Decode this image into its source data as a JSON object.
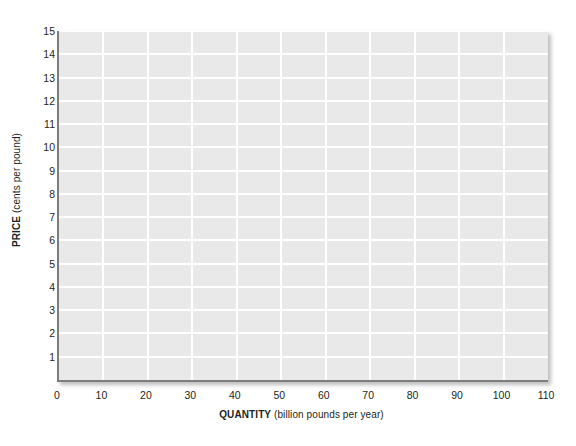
{
  "chart_data": {
    "type": "line",
    "title": "",
    "subtitle": "",
    "xlabel_strong": "QUANTITY",
    "xlabel_weak": " (billion pounds per year)",
    "ylabel_strong": "PRICE",
    "ylabel_weak": " (cents per pound)",
    "xlim": [
      0,
      110
    ],
    "ylim": [
      0,
      15
    ],
    "xticks": [
      0,
      10,
      20,
      30,
      40,
      50,
      60,
      70,
      80,
      90,
      100,
      110
    ],
    "xtick_labels": [
      "0",
      "10",
      "20",
      "30",
      "40",
      "50",
      "60",
      "70",
      "80",
      "90",
      "100",
      "110"
    ],
    "yticks": [
      1,
      2,
      3,
      4,
      5,
      6,
      7,
      8,
      9,
      10,
      11,
      12,
      13,
      14,
      15
    ],
    "ytick_labels": [
      "1",
      "2",
      "3",
      "4",
      "5",
      "6",
      "7",
      "8",
      "9",
      "10",
      "11",
      "12",
      "13",
      "14",
      "15"
    ],
    "grid": true,
    "grid_color": "#ffffff",
    "plot_background": "#e9e9e9",
    "axis_line_color": "#7d7d7d",
    "legend": [],
    "series": [],
    "annotations": [],
    "note": "empty grid worksheet, no data plotted"
  },
  "figure": {
    "background": "#ffffff",
    "text_color": "#231f20"
  }
}
